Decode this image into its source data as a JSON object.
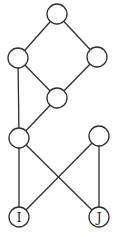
{
  "diagram": {
    "type": "hasse-diagram",
    "colors": {
      "stroke": "#2e2e2e",
      "background": "#ffffff",
      "node_fill": "#ffffff"
    },
    "node_radius": 10,
    "nodes": [
      {
        "id": "top",
        "x": 57,
        "y": 14,
        "label": ""
      },
      {
        "id": "left",
        "x": 18,
        "y": 58,
        "label": ""
      },
      {
        "id": "right",
        "x": 97,
        "y": 57,
        "label": ""
      },
      {
        "id": "middle",
        "x": 57,
        "y": 98,
        "label": ""
      },
      {
        "id": "lower-left",
        "x": 19,
        "y": 138,
        "label": ""
      },
      {
        "id": "lower-right",
        "x": 99,
        "y": 136,
        "label": ""
      },
      {
        "id": "I",
        "x": 19,
        "y": 217,
        "label": "I"
      },
      {
        "id": "J",
        "x": 99,
        "y": 217,
        "label": "J"
      }
    ],
    "edges": [
      [
        "top",
        "left"
      ],
      [
        "top",
        "right"
      ],
      [
        "left",
        "middle"
      ],
      [
        "right",
        "middle"
      ],
      [
        "left",
        "lower-left"
      ],
      [
        "middle",
        "lower-left"
      ],
      [
        "lower-left",
        "I"
      ],
      [
        "lower-left",
        "J"
      ],
      [
        "lower-right",
        "I"
      ],
      [
        "lower-right",
        "J"
      ]
    ]
  }
}
